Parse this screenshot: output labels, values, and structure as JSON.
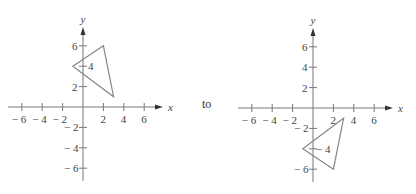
{
  "connector_text": "to",
  "colors": {
    "axis": "#777777",
    "shape": "#888888",
    "text": "#444444"
  },
  "chart_data": [
    {
      "type": "scatter",
      "title": "",
      "xlabel": "x",
      "ylabel": "y",
      "xlim": [
        -7,
        7
      ],
      "ylim": [
        -7,
        7
      ],
      "x_ticks": [
        -6,
        -4,
        -2,
        2,
        4,
        6
      ],
      "y_ticks": [
        6,
        4,
        2,
        -2,
        -4,
        -6
      ],
      "x_tick_labels": [
        "− 6",
        "− 4",
        "− 2",
        "2",
        "4",
        "6"
      ],
      "y_tick_labels": [
        "6",
        "4",
        "2",
        "− 2",
        "− 4",
        "− 6"
      ],
      "grid": false,
      "shape": "triangle",
      "vertices": [
        [
          -1,
          4
        ],
        [
          2,
          6
        ],
        [
          3,
          1
        ]
      ]
    },
    {
      "type": "scatter",
      "title": "",
      "xlabel": "x",
      "ylabel": "y",
      "xlim": [
        -7,
        7
      ],
      "ylim": [
        -7,
        7
      ],
      "x_ticks": [
        -6,
        -4,
        -2,
        2,
        4,
        6
      ],
      "y_ticks": [
        6,
        4,
        2,
        -2,
        -4,
        -6
      ],
      "x_tick_labels": [
        "− 6",
        "− 4",
        "− 2",
        "2",
        "4",
        "6"
      ],
      "y_tick_labels": [
        "6",
        "4",
        "2",
        "− 2",
        "− 4",
        "− 6"
      ],
      "grid": false,
      "shape": "triangle",
      "vertices": [
        [
          -1,
          -4
        ],
        [
          2,
          -6
        ],
        [
          3,
          -1
        ]
      ]
    }
  ]
}
